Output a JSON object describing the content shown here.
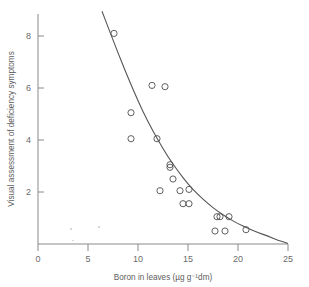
{
  "chart_data": {
    "type": "scatter",
    "title": "",
    "xlabel": "Boron in leaves (µg g⁻¹dm)",
    "ylabel": "Visual assessment of deficiency symptoms",
    "xlim": [
      0,
      25
    ],
    "ylim": [
      0,
      9
    ],
    "xticks": [
      0,
      5,
      10,
      15,
      20,
      25
    ],
    "xtick_labels": [
      "0",
      "5",
      "10",
      "15",
      "20",
      "25"
    ],
    "yticks": [
      2,
      4,
      6,
      8
    ],
    "ytick_labels": [
      "2",
      "4",
      "6",
      "8"
    ],
    "grid": false,
    "legend": null,
    "marker": "open-circle",
    "points": [
      {
        "x": 7.6,
        "y": 8.1
      },
      {
        "x": 11.4,
        "y": 6.1
      },
      {
        "x": 12.7,
        "y": 6.05
      },
      {
        "x": 9.3,
        "y": 5.05
      },
      {
        "x": 9.3,
        "y": 4.05
      },
      {
        "x": 11.9,
        "y": 4.05
      },
      {
        "x": 13.2,
        "y": 3.05
      },
      {
        "x": 13.2,
        "y": 2.95
      },
      {
        "x": 13.5,
        "y": 2.5
      },
      {
        "x": 12.2,
        "y": 2.05
      },
      {
        "x": 14.2,
        "y": 2.05
      },
      {
        "x": 15.1,
        "y": 2.1
      },
      {
        "x": 14.5,
        "y": 1.55
      },
      {
        "x": 15.1,
        "y": 1.55
      },
      {
        "x": 17.9,
        "y": 1.05
      },
      {
        "x": 18.2,
        "y": 1.05
      },
      {
        "x": 19.1,
        "y": 1.05
      },
      {
        "x": 17.7,
        "y": 0.5
      },
      {
        "x": 18.7,
        "y": 0.5
      },
      {
        "x": 20.8,
        "y": 0.55
      }
    ],
    "curve": {
      "kind": "fitted-exponential-decay",
      "description": "smooth monotonically decreasing fitted line",
      "points": [
        {
          "x": 6.4,
          "y": 8.95
        },
        {
          "x": 7.0,
          "y": 8.35
        },
        {
          "x": 8.0,
          "y": 7.35
        },
        {
          "x": 9.0,
          "y": 6.4
        },
        {
          "x": 10.0,
          "y": 5.5
        },
        {
          "x": 11.0,
          "y": 4.7
        },
        {
          "x": 12.0,
          "y": 4.0
        },
        {
          "x": 13.0,
          "y": 3.35
        },
        {
          "x": 14.0,
          "y": 2.8
        },
        {
          "x": 15.0,
          "y": 2.3
        },
        {
          "x": 16.0,
          "y": 1.9
        },
        {
          "x": 17.0,
          "y": 1.55
        },
        {
          "x": 18.0,
          "y": 1.25
        },
        {
          "x": 19.0,
          "y": 1.0
        },
        {
          "x": 20.0,
          "y": 0.78
        },
        {
          "x": 21.0,
          "y": 0.6
        },
        {
          "x": 22.0,
          "y": 0.44
        },
        {
          "x": 23.0,
          "y": 0.3
        },
        {
          "x": 24.0,
          "y": 0.15
        },
        {
          "x": 25.0,
          "y": 0.02
        }
      ]
    }
  }
}
